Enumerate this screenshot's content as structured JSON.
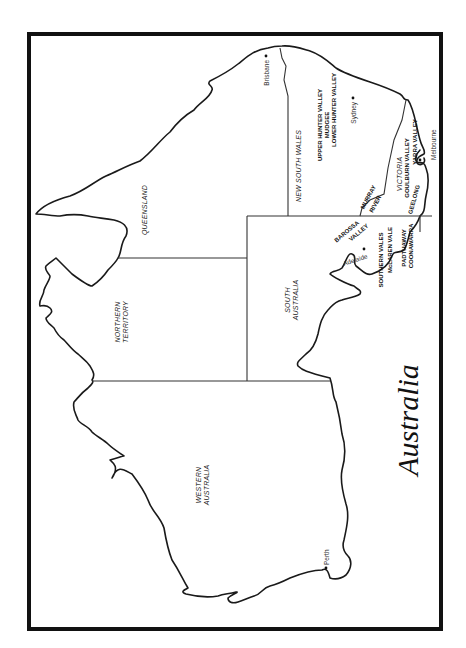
{
  "map": {
    "title": "Australia",
    "orientation": "rotated 90 degrees clockwise (north at left)",
    "colors": {
      "line": "#1a1a1a",
      "frame": "#111111",
      "background": "#ffffff"
    },
    "states": [
      {
        "name": "QUEENSLAND"
      },
      {
        "name": "NORTHERN",
        "name2": "TERRITORY"
      },
      {
        "name": "NEW SOUTH WALES"
      },
      {
        "name": "SOUTH",
        "name2": "AUSTRALIA"
      },
      {
        "name": "WESTERN",
        "name2": "AUSTRALIA"
      },
      {
        "name": "VICTORIA"
      }
    ],
    "cities": [
      {
        "name": "Brisbane"
      },
      {
        "name": "Sydney"
      },
      {
        "name": "Melbourne"
      },
      {
        "name": "Adelaide"
      },
      {
        "name": "Perth"
      }
    ],
    "wine_regions": [
      {
        "name": "UPPER HUNTER VALLEY"
      },
      {
        "name": "MUDGEE"
      },
      {
        "name": "LOWER HUNTER VALLEY"
      },
      {
        "name": "GOULBURN VALLEY"
      },
      {
        "name": "YARRA VALLEY"
      },
      {
        "name": "MURRAY"
      },
      {
        "name": "RIVER"
      },
      {
        "name": "GEELONG"
      },
      {
        "name": "BAROSSA"
      },
      {
        "name": "VALLEY"
      },
      {
        "name": "SOUTHERN VALES"
      },
      {
        "name": "McLAREN VALE"
      },
      {
        "name": "PADTHAWAY"
      },
      {
        "name": "COONAWARRA"
      }
    ]
  }
}
